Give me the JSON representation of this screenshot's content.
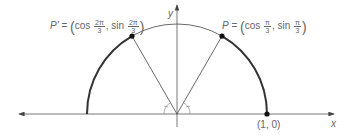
{
  "diagram": {
    "type": "unit-circle-upper-half",
    "axes": {
      "x_label": "x",
      "y_label": "y"
    },
    "origin_px": [
      177,
      114
    ],
    "radius_px": 90,
    "points": [
      {
        "id": "P",
        "name": "P",
        "eq": "=",
        "cos_arg_num": "π",
        "cos_arg_den": "3",
        "sin_arg_num": "π",
        "sin_arg_den": "3",
        "angle_deg": 60
      },
      {
        "id": "P_prime",
        "name": "P'",
        "eq": "=",
        "cos_arg_num": "2π",
        "cos_arg_den": "3",
        "sin_arg_num": "2π",
        "sin_arg_den": "3",
        "angle_deg": 120
      },
      {
        "id": "one_zero",
        "label": "(1, 0)",
        "angle_deg": 0
      }
    ],
    "text": {
      "cos": "cos",
      "sin": "sin",
      "comma": ",",
      "lparen": "(",
      "rparen": ")"
    },
    "colors": {
      "line": "#444444",
      "arc": "#333333",
      "text": "#666666",
      "point": "#111111"
    }
  }
}
